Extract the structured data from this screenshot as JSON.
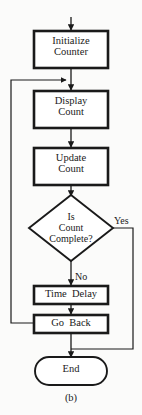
{
  "figure": {
    "caption": "(b)",
    "colors": {
      "background": "#fbfbfa",
      "stroke": "#1a1a1a",
      "fill": "#ffffff"
    }
  },
  "nodes": {
    "initialize": {
      "shape": "process",
      "line1": "Initialize",
      "line2": "Counter"
    },
    "display": {
      "shape": "process",
      "line1": "Display",
      "line2": "Count"
    },
    "update": {
      "shape": "process",
      "line1": "Update",
      "line2": "Count"
    },
    "decision": {
      "shape": "decision",
      "line1": "Is",
      "line2": "Count",
      "line3": "Complete?"
    },
    "time_delay": {
      "shape": "process",
      "line1": "Time  Delay"
    },
    "go_back": {
      "shape": "process",
      "line1": "Go  Back"
    },
    "end": {
      "shape": "terminator",
      "line1": "End"
    }
  },
  "edges": {
    "yes_label": "Yes",
    "no_label": "No"
  }
}
